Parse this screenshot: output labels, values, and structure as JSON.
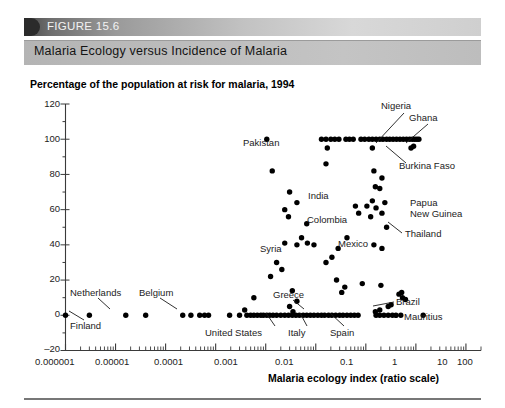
{
  "figure": {
    "number_label": "FIGURE 15.6",
    "caption": "Malaria Ecology versus Incidence of Malaria"
  },
  "chart_data": {
    "type": "scatter",
    "title": "Percentage of the population at risk for malaria, 1994",
    "xlabel": "Malaria ecology index (ratio scale)",
    "ylabel": "",
    "xscale": "log",
    "xlim": [
      1e-06,
      200
    ],
    "ylim": [
      -20,
      120
    ],
    "yticks": [
      -20,
      0,
      20,
      40,
      60,
      80,
      100,
      120
    ],
    "ytick_labels": [
      "–20",
      "0",
      "20",
      "40",
      "60",
      "80",
      "100",
      "120"
    ],
    "xticks": [
      1e-06,
      1e-05,
      0.0001,
      0.001,
      0.01,
      0.1,
      1,
      10,
      100
    ],
    "xtick_labels": [
      "0.000001",
      "0.00001",
      "0.0001",
      "0.001",
      "0.01",
      "0.1",
      "1",
      "10",
      "100"
    ],
    "grid": false,
    "legend": "none",
    "points": [
      [
        1e-06,
        0
      ],
      [
        3e-06,
        0
      ],
      [
        1.6e-05,
        0
      ],
      [
        4e-05,
        0
      ],
      [
        0.00022,
        0
      ],
      [
        0.00032,
        0
      ],
      [
        0.00048,
        0
      ],
      [
        0.0006,
        0
      ],
      [
        0.00072,
        0
      ],
      [
        0.0019,
        0
      ],
      [
        0.003,
        0
      ],
      [
        0.0042,
        0
      ],
      [
        0.005,
        0
      ],
      [
        0.0058,
        0
      ],
      [
        0.0068,
        0
      ],
      [
        0.008,
        0
      ],
      [
        0.009,
        0
      ],
      [
        0.0105,
        0
      ],
      [
        0.012,
        0
      ],
      [
        0.014,
        0
      ],
      [
        0.0165,
        0
      ],
      [
        0.02,
        0
      ],
      [
        0.024,
        0
      ],
      [
        0.0285,
        0
      ],
      [
        0.034,
        0
      ],
      [
        0.04,
        0
      ],
      [
        0.047,
        0
      ],
      [
        0.056,
        0
      ],
      [
        0.066,
        0
      ],
      [
        0.078,
        0
      ],
      [
        0.092,
        0
      ],
      [
        0.11,
        0
      ],
      [
        0.13,
        0
      ],
      [
        0.15,
        0
      ],
      [
        0.18,
        0
      ],
      [
        0.21,
        0
      ],
      [
        0.25,
        0
      ],
      [
        0.3,
        0
      ],
      [
        0.35,
        0
      ],
      [
        0.42,
        0
      ],
      [
        0.5,
        0
      ],
      [
        0.59,
        0
      ],
      [
        0.7,
        0
      ],
      [
        0.0058,
        10
      ],
      [
        0.03,
        5
      ],
      [
        0.035,
        2
      ],
      [
        0.0038,
        3
      ],
      [
        1.6,
        0
      ],
      [
        1.9,
        0
      ],
      [
        2.3,
        0
      ],
      [
        2.8,
        0
      ],
      [
        3.4,
        0
      ],
      [
        4.0,
        0
      ],
      [
        5.0,
        0
      ],
      [
        1.55,
        2
      ],
      [
        1.9,
        3
      ],
      [
        2.8,
        5
      ],
      [
        3.2,
        6
      ],
      [
        4.6,
        12
      ],
      [
        5.2,
        13
      ],
      [
        5.4,
        10
      ],
      [
        6.2,
        9
      ],
      [
        2.0,
        17
      ],
      [
        0.85,
        18
      ],
      [
        14.0,
        0
      ],
      [
        0.0105,
        100
      ],
      [
        0.0135,
        82
      ],
      [
        0.03,
        70
      ],
      [
        0.042,
        64
      ],
      [
        0.024,
        60
      ],
      [
        0.0285,
        56
      ],
      [
        0.066,
        52
      ],
      [
        0.052,
        44
      ],
      [
        0.068,
        41
      ],
      [
        0.042,
        40
      ],
      [
        0.092,
        40
      ],
      [
        0.024,
        41
      ],
      [
        0.0165,
        30
      ],
      [
        0.021,
        26
      ],
      [
        0.0125,
        22
      ],
      [
        0.034,
        14
      ],
      [
        0.042,
        8
      ],
      [
        0.13,
        100
      ],
      [
        0.16,
        100
      ],
      [
        0.2,
        100
      ],
      [
        0.24,
        100
      ],
      [
        0.29,
        100
      ],
      [
        0.4,
        100
      ],
      [
        0.47,
        100
      ],
      [
        0.56,
        100
      ],
      [
        0.8,
        100
      ],
      [
        0.95,
        100
      ],
      [
        1.15,
        100
      ],
      [
        1.35,
        100
      ],
      [
        1.6,
        100
      ],
      [
        1.9,
        100
      ],
      [
        2.2,
        100
      ],
      [
        2.6,
        100
      ],
      [
        3.0,
        100
      ],
      [
        3.5,
        100
      ],
      [
        4.1,
        100
      ],
      [
        4.8,
        100
      ],
      [
        5.6,
        100
      ],
      [
        6.5,
        100
      ],
      [
        7.5,
        100
      ],
      [
        8.5,
        100
      ],
      [
        9.5,
        100
      ],
      [
        10.5,
        100
      ],
      [
        11.5,
        100
      ],
      [
        0.17,
        95
      ],
      [
        1.35,
        95
      ],
      [
        8.0,
        95
      ],
      [
        9.0,
        96
      ],
      [
        0.16,
        86
      ],
      [
        1.45,
        82
      ],
      [
        1.55,
        73
      ],
      [
        1.35,
        65
      ],
      [
        1.6,
        61
      ],
      [
        1.9,
        72
      ],
      [
        2.1,
        78
      ],
      [
        2.4,
        64
      ],
      [
        2.1,
        58
      ],
      [
        1.05,
        62
      ],
      [
        1.25,
        56
      ],
      [
        2.6,
        50
      ],
      [
        1.45,
        40
      ],
      [
        2.1,
        38
      ],
      [
        0.62,
        62
      ],
      [
        0.72,
        58
      ],
      [
        0.42,
        44
      ],
      [
        0.28,
        38
      ],
      [
        0.21,
        33
      ],
      [
        0.16,
        30
      ],
      [
        0.26,
        20
      ],
      [
        0.33,
        13
      ],
      [
        0.38,
        16
      ]
    ],
    "annotations": [
      {
        "label": "Nigeria",
        "leader": true
      },
      {
        "label": "Ghana",
        "leader": true
      },
      {
        "label": "Burkina Faso",
        "leader": true
      },
      {
        "label": "Pakistan",
        "leader": false
      },
      {
        "label": "India",
        "leader": false
      },
      {
        "label": "Colombia",
        "leader": false
      },
      {
        "label": "Papua\nNew Guinea",
        "leader": false
      },
      {
        "label": "Thailand",
        "leader": true
      },
      {
        "label": "Syria",
        "leader": false
      },
      {
        "label": "Mexico",
        "leader": false
      },
      {
        "label": "Netherlands",
        "leader": true
      },
      {
        "label": "Finland",
        "leader": true
      },
      {
        "label": "Belgium",
        "leader": true
      },
      {
        "label": "Greece",
        "leader": true
      },
      {
        "label": "United States",
        "leader": true
      },
      {
        "label": "Italy",
        "leader": true
      },
      {
        "label": "Spain",
        "leader": true
      },
      {
        "label": "Brazil",
        "leader": true
      },
      {
        "label": "Mauritius",
        "leader": false
      }
    ]
  },
  "annotation_text": {
    "nigeria": "Nigeria",
    "ghana": "Ghana",
    "burkina_faso": "Burkina Faso",
    "pakistan": "Pakistan",
    "india": "India",
    "colombia": "Colombia",
    "papua_line1": "Papua",
    "papua_line2": "New Guinea",
    "thailand": "Thailand",
    "syria": "Syria",
    "mexico": "Mexico",
    "netherlands": "Netherlands",
    "finland": "Finland",
    "belgium": "Belgium",
    "greece": "Greece",
    "united_states": "United States",
    "italy": "Italy",
    "spain": "Spain",
    "brazil": "Brazil",
    "mauritius": "Mauritius"
  },
  "colors": {
    "point": "#000000",
    "axis": "#3a3a3a",
    "header_dark": "#2b2b2b",
    "header_light": "#c4c4c4"
  }
}
